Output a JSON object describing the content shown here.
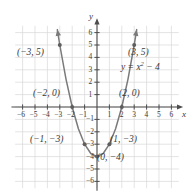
{
  "chart_data": {
    "type": "line",
    "title": "",
    "subtitle": "",
    "xlabel": "x",
    "ylabel": "y",
    "xlim": [
      -6.8,
      6.8
    ],
    "ylim": [
      -6.8,
      6.8
    ],
    "grid": true,
    "legend": null,
    "equation_label": "y = x",
    "equation_exponent": "2",
    "equation_tail": " − 4",
    "equation_plain": "y = x² − 4",
    "x_ticks": [
      "-6",
      "-5",
      "-4",
      "-3",
      "-2",
      "-1",
      "1",
      "2",
      "3",
      "4",
      "5",
      "6"
    ],
    "x_tick_values": [
      -6,
      -5,
      -4,
      -3,
      -2,
      -1,
      1,
      2,
      3,
      4,
      5,
      6
    ],
    "y_ticks": [
      "6",
      "5",
      "4",
      "3",
      "2",
      "1",
      "-1",
      "-2",
      "-3",
      "-4",
      "-5",
      "-6"
    ],
    "y_tick_values": [
      6,
      5,
      4,
      3,
      2,
      1,
      -1,
      -2,
      -3,
      -4,
      -5,
      -6
    ],
    "series": [
      {
        "name": "y = x² − 4",
        "color": "#7a7a7a",
        "x": [
          -3.2,
          -3.0,
          -2.5,
          -2.0,
          -1.5,
          -1.0,
          -0.5,
          0.0,
          0.5,
          1.0,
          1.5,
          2.0,
          2.5,
          3.0,
          3.2
        ],
        "y": [
          6.24,
          5.0,
          2.25,
          0.0,
          -1.75,
          -3.0,
          -3.75,
          -4.0,
          -3.75,
          -3.0,
          -1.75,
          0.0,
          2.25,
          5.0,
          6.24
        ]
      }
    ],
    "marked_points": [
      {
        "label": "(−3, 5)",
        "x": -3,
        "y": 5,
        "label_side": "left"
      },
      {
        "label": "(3, 5)",
        "x": 3,
        "y": 5,
        "label_side": "right"
      },
      {
        "label": "(−2, 0)",
        "x": -2,
        "y": 0,
        "label_side": "left"
      },
      {
        "label": "(2, 0)",
        "x": 2,
        "y": 0,
        "label_side": "right"
      },
      {
        "label": "(−1, −3)",
        "x": -1,
        "y": -3,
        "label_side": "left"
      },
      {
        "label": "(1, −3)",
        "x": 1,
        "y": -3,
        "label_side": "right"
      },
      {
        "label": "(0, −4)",
        "x": 0,
        "y": -4,
        "label_side": "right"
      }
    ]
  },
  "labels": {
    "point_n3_5": "(−3, 5)",
    "point_3_5": "(3, 5)",
    "point_n2_0": "(−2, 0)",
    "point_2_0": "(2, 0)",
    "point_n1_n3": "(−1, −3)",
    "point_1_n3": "(1, −3)",
    "point_0_n4": "(0, −4)",
    "equation_head": "y = x",
    "equation_exp": "2",
    "equation_tail": " − 4",
    "axis_x": "x",
    "axis_y": "y"
  },
  "ticks": {
    "x_neg": [
      "−6",
      "−5",
      "−4",
      "−3",
      "−2",
      "−1"
    ],
    "x_pos": [
      "1",
      "2",
      "3",
      "4",
      "5",
      "6"
    ],
    "y_pos": [
      "6",
      "5",
      "4",
      "3",
      "2",
      "1"
    ],
    "y_neg": [
      "−1",
      "−2",
      "−3",
      "−4",
      "−5",
      "−6"
    ]
  },
  "colors": {
    "curve": "#7a7a7a",
    "axis": "#4d4d4d",
    "grid": "#d9d9d9",
    "text": "#3a3a3a",
    "point": "#5e5e5e",
    "background": "#ffffff"
  }
}
